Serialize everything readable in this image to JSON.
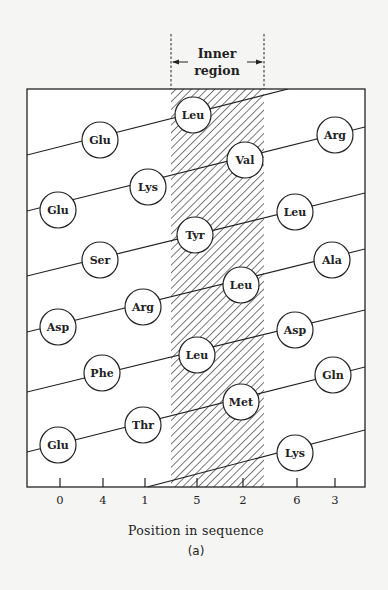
{
  "figure": {
    "caption": "(a)",
    "inner_region_label_line1": "Inner",
    "inner_region_label_line2": "region",
    "x_axis_title": "Position in sequence",
    "colors": {
      "background": "#f5f5f3",
      "ink": "#222222",
      "hatch": "#333333",
      "circle_fill": "#ffffff"
    },
    "frame": {
      "left": 27,
      "top": 89,
      "right": 365,
      "bottom": 487
    },
    "inner_region": {
      "x1": 171,
      "x2": 264,
      "dash_top": 34
    },
    "x_ticks": [
      {
        "label": "0",
        "x": 60
      },
      {
        "label": "4",
        "x": 103
      },
      {
        "label": "1",
        "x": 145
      },
      {
        "label": "5",
        "x": 197
      },
      {
        "label": "2",
        "x": 243
      },
      {
        "label": "6",
        "x": 297
      },
      {
        "label": "3",
        "x": 335
      }
    ],
    "helix_lines": [
      {
        "x1": 27,
        "y1": 155,
        "x2": 288,
        "y2": 89
      },
      {
        "x1": 27,
        "y1": 211,
        "x2": 365,
        "y2": 127
      },
      {
        "x1": 27,
        "y1": 276,
        "x2": 365,
        "y2": 193
      },
      {
        "x1": 27,
        "y1": 332,
        "x2": 365,
        "y2": 249
      },
      {
        "x1": 27,
        "y1": 392,
        "x2": 365,
        "y2": 310
      },
      {
        "x1": 27,
        "y1": 452,
        "x2": 365,
        "y2": 367
      },
      {
        "x1": 147,
        "y1": 487,
        "x2": 365,
        "y2": 430
      }
    ],
    "residues": [
      {
        "name": "Leu",
        "x": 193,
        "y": 115
      },
      {
        "name": "Glu",
        "x": 100,
        "y": 140
      },
      {
        "name": "Arg",
        "x": 335,
        "y": 135
      },
      {
        "name": "Val",
        "x": 245,
        "y": 160
      },
      {
        "name": "Lys",
        "x": 148,
        "y": 187
      },
      {
        "name": "Glu",
        "x": 58,
        "y": 210
      },
      {
        "name": "Leu",
        "x": 295,
        "y": 212
      },
      {
        "name": "Tyr",
        "x": 195,
        "y": 235
      },
      {
        "name": "Ser",
        "x": 100,
        "y": 260
      },
      {
        "name": "Ala",
        "x": 332,
        "y": 260
      },
      {
        "name": "Leu",
        "x": 241,
        "y": 285
      },
      {
        "name": "Arg",
        "x": 143,
        "y": 307
      },
      {
        "name": "Asp",
        "x": 58,
        "y": 327
      },
      {
        "name": "Asp",
        "x": 295,
        "y": 330
      },
      {
        "name": "Leu",
        "x": 197,
        "y": 355
      },
      {
        "name": "Phe",
        "x": 102,
        "y": 373
      },
      {
        "name": "Gln",
        "x": 333,
        "y": 375
      },
      {
        "name": "Met",
        "x": 241,
        "y": 402
      },
      {
        "name": "Thr",
        "x": 143,
        "y": 425
      },
      {
        "name": "Glu",
        "x": 58,
        "y": 445
      },
      {
        "name": "Lys",
        "x": 295,
        "y": 453
      }
    ],
    "residue_radius": 18
  }
}
